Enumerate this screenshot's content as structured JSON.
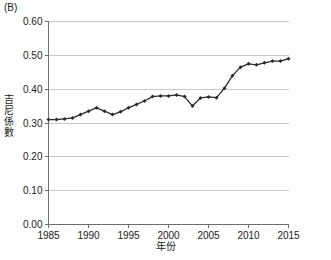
{
  "figure": {
    "panel_label": "(B)",
    "ylabel": "吉尼係數",
    "xlabel": "年份"
  },
  "chart_data": {
    "type": "line",
    "title": "",
    "subtitle": "",
    "panel": "(B)",
    "xlabel": "年份",
    "ylabel": "吉尼係數",
    "xlim": [
      1985,
      2015
    ],
    "ylim": [
      0.0,
      0.6
    ],
    "yticks": [
      0.0,
      0.1,
      0.2,
      0.3,
      0.4,
      0.5,
      0.6
    ],
    "ytick_labels": [
      "0.00",
      "0.10",
      "0.20",
      "0.30",
      "0.40",
      "0.50",
      "0.60"
    ],
    "xticks": [
      1985,
      1990,
      1995,
      2000,
      2005,
      2010,
      2015
    ],
    "xtick_labels": [
      "1985",
      "1990",
      "1995",
      "2000",
      "2005",
      "2010",
      "2015"
    ],
    "grid": "horizontal",
    "legend": "none",
    "markers": "filled-diamond",
    "line_color": "#2b2b2b",
    "grid_color": "#c9c9c9",
    "axis_color": "#6e6e6e",
    "x": [
      1985,
      1986,
      1987,
      1988,
      1989,
      1990,
      1991,
      1992,
      1993,
      1994,
      1995,
      1996,
      1997,
      1998,
      1999,
      2000,
      2001,
      2002,
      2003,
      2004,
      2005,
      2006,
      2007,
      2008,
      2009,
      2010,
      2011,
      2012,
      2013,
      2014,
      2015
    ],
    "values": [
      0.31,
      0.31,
      0.312,
      0.315,
      0.325,
      0.335,
      0.345,
      0.335,
      0.325,
      0.333,
      0.345,
      0.355,
      0.365,
      0.378,
      0.38,
      0.38,
      0.383,
      0.378,
      0.35,
      0.374,
      0.377,
      0.375,
      0.403,
      0.44,
      0.465,
      0.475,
      0.472,
      0.478,
      0.483,
      0.483,
      0.49
    ]
  }
}
